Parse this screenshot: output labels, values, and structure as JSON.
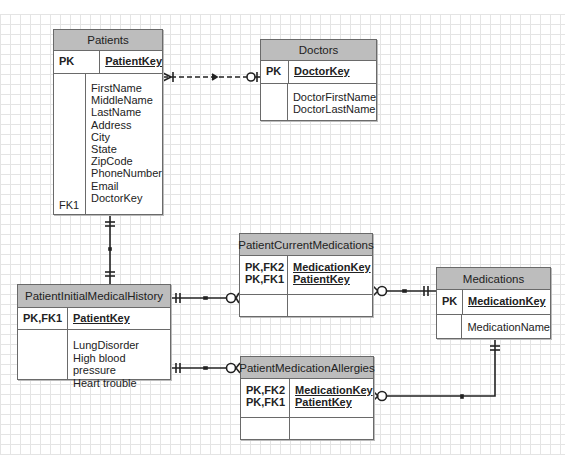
{
  "diagram": {
    "type": "entity-relationship",
    "notation": "crows-foot",
    "entities": {
      "patients": {
        "name": "Patients",
        "keys": [
          {
            "label": "PK",
            "field": "PatientKey"
          }
        ],
        "attributes": [
          "FirstName",
          "MiddleName",
          "LastName",
          "Address",
          "City",
          "State",
          "ZipCode",
          "PhoneNumber",
          "Email",
          "DoctorKey"
        ],
        "fk_label": "FK1"
      },
      "doctors": {
        "name": "Doctors",
        "keys": [
          {
            "label": "PK",
            "field": "DoctorKey"
          }
        ],
        "attributes": [
          "DoctorFirstName",
          "DoctorLastName"
        ]
      },
      "patient_initial_medical_history": {
        "name": "PatientInitialMedicalHistory",
        "keys": [
          {
            "label": "PK,FK1",
            "field": "PatientKey"
          }
        ],
        "attributes": [
          "LungDisorder",
          "High blood pressure",
          "Heart trouble"
        ]
      },
      "patient_current_medications": {
        "name": "PatientCurrentMedications",
        "keys": [
          {
            "label": "PK,FK2",
            "field": "MedicationKey"
          },
          {
            "label": "PK,FK1",
            "field": "PatientKey"
          }
        ],
        "attributes": []
      },
      "medications": {
        "name": "Medications",
        "keys": [
          {
            "label": "PK",
            "field": "MedicationKey"
          }
        ],
        "attributes": [
          "MedicationName"
        ]
      },
      "patient_medication_allergies": {
        "name": "PatientMedicationAllergies",
        "keys": [
          {
            "label": "PK,FK2",
            "field": "MedicationKey"
          },
          {
            "label": "PK,FK1",
            "field": "PatientKey"
          }
        ],
        "attributes": []
      }
    },
    "relationships": [
      {
        "from": "Patients",
        "to": "Doctors",
        "from_end": "many",
        "to_end": "zero-or-one",
        "style": "dashed"
      },
      {
        "from": "Patients",
        "to": "PatientInitialMedicalHistory",
        "from_end": "one-and-only-one",
        "to_end": "one-and-only-one",
        "style": "solid"
      },
      {
        "from": "PatientInitialMedicalHistory",
        "to": "PatientCurrentMedications",
        "from_end": "one-and-only-one",
        "to_end": "zero-or-many",
        "style": "solid"
      },
      {
        "from": "PatientInitialMedicalHistory",
        "to": "PatientMedicationAllergies",
        "from_end": "one-and-only-one",
        "to_end": "zero-or-many",
        "style": "solid"
      },
      {
        "from": "Medications",
        "to": "PatientCurrentMedications",
        "from_end": "one-and-only-one",
        "to_end": "zero-or-many",
        "style": "solid"
      },
      {
        "from": "Medications",
        "to": "PatientMedicationAllergies",
        "from_end": "one-and-only-one",
        "to_end": "zero-or-many",
        "style": "solid"
      }
    ],
    "colors": {
      "header_fill": "#bdbdbd",
      "border": "#6a6a6a",
      "line": "#222222",
      "grid": "#e4e4e4"
    }
  }
}
